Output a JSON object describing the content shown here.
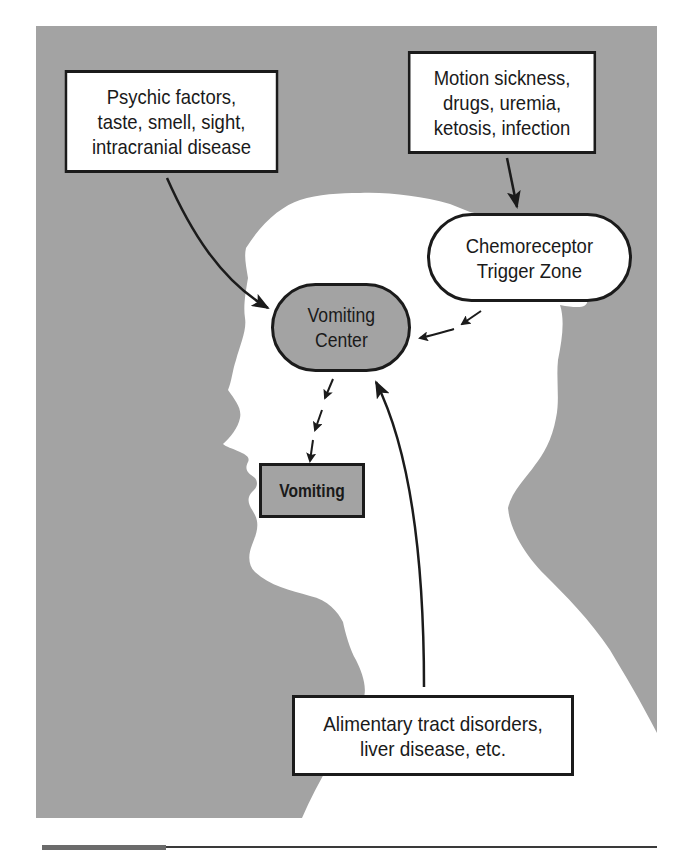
{
  "figure": {
    "colors": {
      "panel_gray": "#a3a3a3",
      "silhouette": "#ffffff",
      "stroke": "#1b1b1b",
      "node_gray": "#a3a3a3"
    },
    "nodes": {
      "psychic": {
        "shape": "rectangle",
        "label": "Psychic factors,\ntaste, smell, sight,\nintracranial disease"
      },
      "motion": {
        "shape": "rectangle",
        "label": "Motion sickness,\ndrugs, uremia,\nketosis, infection"
      },
      "ctz": {
        "shape": "pill",
        "label": "Chemoreceptor\nTrigger Zone"
      },
      "vomiting_center": {
        "shape": "pill-filled",
        "label": "Vomiting\nCenter"
      },
      "vomiting": {
        "shape": "rectangle-filled",
        "label": "Vomiting"
      },
      "alimentary": {
        "shape": "rectangle",
        "label": "Alimentary tract disorders,\nliver disease, etc."
      }
    },
    "edges": [
      {
        "from": "psychic",
        "to": "vomiting_center",
        "style": "solid"
      },
      {
        "from": "motion",
        "to": "ctz",
        "style": "solid"
      },
      {
        "from": "ctz",
        "to": "vomiting_center",
        "style": "dashed"
      },
      {
        "from": "vomiting_center",
        "to": "vomiting",
        "style": "dashed"
      },
      {
        "from": "alimentary",
        "to": "vomiting_center",
        "style": "solid"
      }
    ],
    "background": "head-and-shoulders profile silhouette facing left"
  }
}
